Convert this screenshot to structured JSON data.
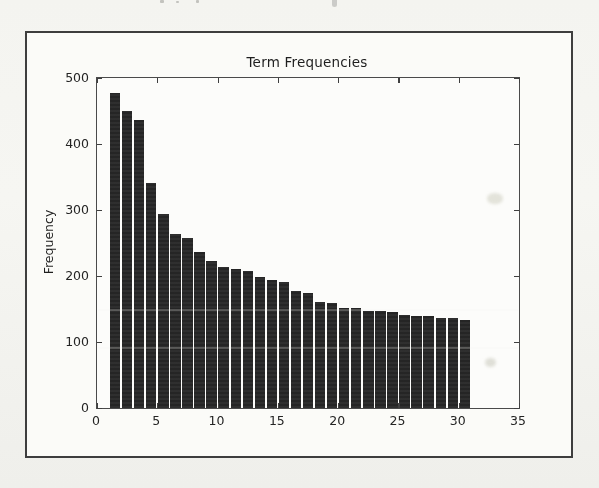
{
  "figure": {
    "title": "Term Frequencies",
    "ylabel": "Frequency",
    "xlabel": ""
  },
  "chart_data": {
    "type": "bar",
    "title": "Term Frequencies",
    "xlabel": "",
    "ylabel": "Frequency",
    "x": [
      1,
      2,
      3,
      4,
      5,
      6,
      7,
      8,
      9,
      10,
      11,
      12,
      13,
      14,
      15,
      16,
      17,
      18,
      19,
      20,
      21,
      22,
      23,
      24,
      25,
      26,
      27,
      28,
      29,
      30
    ],
    "values": [
      478,
      450,
      437,
      341,
      294,
      264,
      258,
      236,
      223,
      214,
      210,
      207,
      199,
      194,
      191,
      178,
      175,
      160,
      159,
      152,
      152,
      147,
      147,
      146,
      141,
      140,
      140,
      137,
      136,
      133
    ],
    "bar_width": 1,
    "align": "edge",
    "xlim": [
      0,
      35
    ],
    "ylim": [
      0,
      500
    ],
    "xticks": [
      0,
      5,
      10,
      15,
      20,
      25,
      30,
      35
    ],
    "yticks": [
      0,
      100,
      200,
      300,
      400,
      500
    ],
    "grid": false,
    "legend": null,
    "bar_color": "#272727",
    "background": "#fbfbf8"
  }
}
